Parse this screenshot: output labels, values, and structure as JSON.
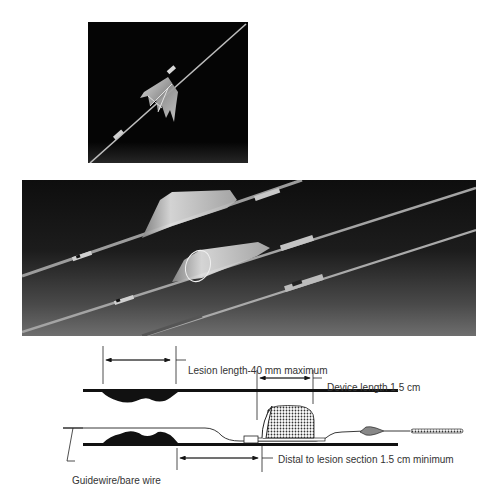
{
  "figure": {
    "photo_top": {
      "description": "Deployed filter device with umbrella-shaped membrane on guidewire, black background"
    },
    "photo_middle": {
      "description": "Three catheter-mounted devices shown diagonally: partially and fully deployed cone membranes, and collapsed state"
    },
    "diagram": {
      "labels": {
        "lesion_length": "Lesion length-40 mm maximum",
        "device_length": "Device length 1.5 cm",
        "distal_section": "Distal to lesion section 1.5 cm minimum",
        "guidewire": "Guidewire/bare wire"
      }
    }
  },
  "colors": {
    "background": "#ffffff",
    "photo_bg": "#050505",
    "ink": "#111111",
    "label_text": "#333333"
  }
}
